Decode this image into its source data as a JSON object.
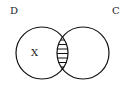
{
  "diagram": {
    "type": "venn",
    "sets": [
      {
        "label": "D",
        "cx": 42,
        "cy": 53,
        "r": 26
      },
      {
        "label": "C",
        "cx": 83,
        "cy": 53,
        "r": 26
      }
    ],
    "region_label": "X",
    "shaded_region": "D ∩ C",
    "shading": "horizontal-hatch",
    "hatch_lines": 11,
    "colors": {
      "stroke": "#111111",
      "background": "#ffffff"
    }
  }
}
